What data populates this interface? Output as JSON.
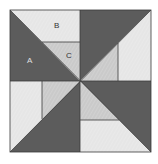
{
  "diagram": {
    "type": "quilt-block",
    "labels": {
      "a": "A",
      "b": "B",
      "c": "C"
    },
    "colors": {
      "dark": "#5c5c5c",
      "light": "#e6e6e6",
      "medium": "#cacaca",
      "line": "#3a3a3a",
      "background": "#ffffff"
    }
  }
}
